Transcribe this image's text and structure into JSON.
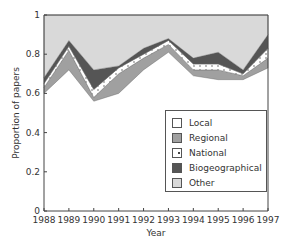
{
  "chart_data": {
    "type": "area",
    "stacked": true,
    "title": "",
    "xlabel": "Year",
    "ylabel": "Proportion of papers",
    "x": [
      1988,
      1989,
      1990,
      1991,
      1992,
      1993,
      1994,
      1995,
      1996,
      1997
    ],
    "ylim": [
      0,
      1
    ],
    "yticks": [
      "0",
      "0.2",
      "0.4",
      "0.6",
      "0.8",
      "1"
    ],
    "xticks": [
      "1988",
      "1989",
      "1990",
      "1991",
      "1992",
      "1993",
      "1994",
      "1995",
      "1996",
      "1997"
    ],
    "grid": false,
    "legend_position": "lower right inside",
    "series": [
      {
        "name": "Local",
        "color": "#ffffff",
        "values": [
          0.6,
          0.72,
          0.56,
          0.6,
          0.72,
          0.81,
          0.69,
          0.67,
          0.67,
          0.73
        ]
      },
      {
        "name": "Regional",
        "color": "#a0a0a0",
        "values": [
          0.03,
          0.1,
          0.02,
          0.1,
          0.06,
          0.04,
          0.03,
          0.05,
          0.02,
          0.05
        ]
      },
      {
        "name": "National",
        "color": "#ffffff",
        "pattern": "dotted",
        "values": [
          0.02,
          0.02,
          0.04,
          0.03,
          0.02,
          0.02,
          0.03,
          0.03,
          0.01,
          0.05
        ]
      },
      {
        "name": "Biogeographical",
        "color": "#555555",
        "values": [
          0.03,
          0.03,
          0.1,
          0.01,
          0.03,
          0.01,
          0.03,
          0.06,
          0.02,
          0.07
        ]
      },
      {
        "name": "Other",
        "color": "#d9d9d9",
        "values": [
          0.32,
          0.13,
          0.28,
          0.26,
          0.17,
          0.12,
          0.22,
          0.19,
          0.28,
          0.1
        ]
      }
    ]
  },
  "legend": {
    "items": [
      {
        "label": "Local",
        "color": "#ffffff"
      },
      {
        "label": "Regional",
        "color": "#a0a0a0"
      },
      {
        "label": "National",
        "color": "#ffffff"
      },
      {
        "label": "Biogeographical",
        "color": "#555555"
      },
      {
        "label": "Other",
        "color": "#d9d9d9"
      }
    ]
  }
}
